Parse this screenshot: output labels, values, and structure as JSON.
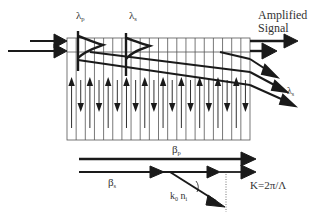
{
  "labels": {
    "lambda_p": "λ",
    "lambda_p_sub": "p",
    "lambda_s": "λ",
    "lambda_s_sub": "s",
    "amplified_signal_line1": "Amplified",
    "amplified_signal_line2": "Signal",
    "lambda_s_out": "λ",
    "lambda_s_out_sub": "s",
    "beta_p": "β",
    "beta_p_sub": "p",
    "beta_s": "β",
    "beta_s_sub": "s",
    "k0ni_k": "k",
    "k0ni_k_sub": "0",
    "k0ni_n": " n",
    "k0ni_n_sub": "i",
    "grating_vector": "K=2π/Λ"
  },
  "colors": {
    "line": "#1a1a1a",
    "grid": "#555555",
    "text": "#333333",
    "background": "#ffffff"
  },
  "grating": {
    "x_start": 67,
    "x_end": 250,
    "y_top": 38,
    "y_band": 52,
    "y_bottom": 140,
    "num_lines": 20
  }
}
